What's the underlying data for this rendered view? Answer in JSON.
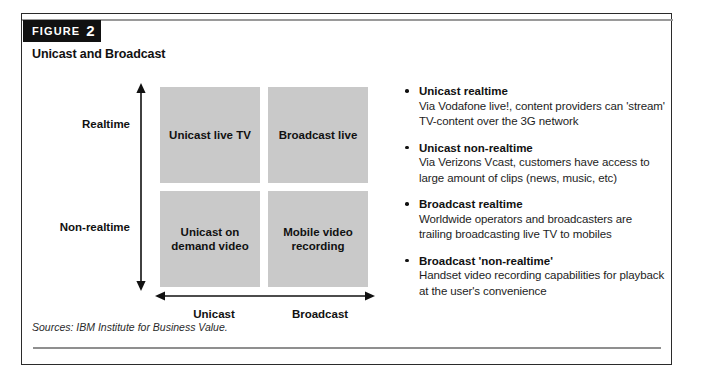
{
  "figure": {
    "tag_word": "FIGURE",
    "tag_number": "2",
    "subtitle": "Unicast and Broadcast"
  },
  "matrix": {
    "y_axis": {
      "top_label": "Realtime",
      "bottom_label": "Non-realtime"
    },
    "x_axis": {
      "left_label": "Unicast",
      "right_label": "Broadcast"
    },
    "cells": [
      {
        "position": "top-left",
        "label": "Unicast live TV"
      },
      {
        "position": "top-right",
        "label": "Broadcast live"
      },
      {
        "position": "bottom-left",
        "label": "Unicast on demand video"
      },
      {
        "position": "bottom-right",
        "label": "Mobile video recording"
      }
    ],
    "fill_color": "#c9c9c9",
    "divider_color": "#ffffff"
  },
  "bullets": [
    {
      "title": "Unicast realtime",
      "body": "Via Vodafone live!, content providers can 'stream' TV-content over the 3G network"
    },
    {
      "title": "Unicast non-realtime",
      "body": "Via Verizons Vcast, customers have access to large amount of clips (news, music, etc)"
    },
    {
      "title": "Broadcast realtime",
      "body": "Worldwide operators and broadcasters are trailing broadcasting live TV to mobiles"
    },
    {
      "title": "Broadcast 'non-realtime'",
      "body": "Handset video recording capabilities for playback at the user's convenience"
    }
  ],
  "footer": {
    "sources": "Sources: IBM Institute for Business Value."
  }
}
